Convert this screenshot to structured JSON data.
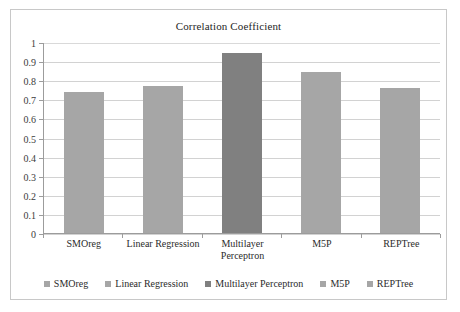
{
  "chart_data": {
    "type": "bar",
    "title": "Correlation Coefficient",
    "xlabel": "",
    "ylabel": "",
    "ylim": [
      0,
      1
    ],
    "ytick_labels": [
      "1",
      "0.9",
      "0.8",
      "0.7",
      "0.6",
      "0.5",
      "0.4",
      "0.3",
      "0.2",
      "0.1",
      "0"
    ],
    "ytick_values": [
      1,
      0.9,
      0.8,
      0.7,
      0.6,
      0.5,
      0.4,
      0.3,
      0.2,
      0.1,
      0
    ],
    "grid": true,
    "legend_position": "bottom",
    "categories": [
      "SMOreg",
      "Linear Regression",
      "Multilayer\nPerceptron",
      "M5P",
      "REPTree"
    ],
    "values": [
      0.74,
      0.775,
      0.945,
      0.845,
      0.765
    ],
    "bar_colors": [
      "#a6a6a6",
      "#a6a6a6",
      "#808080",
      "#a6a6a6",
      "#a6a6a6"
    ],
    "legend": [
      {
        "label": "SMOreg",
        "color": "#a6a6a6"
      },
      {
        "label": "Linear Regression",
        "color": "#a6a6a6"
      },
      {
        "label": "Multilayer Perceptron",
        "color": "#808080"
      },
      {
        "label": "M5P",
        "color": "#a6a6a6"
      },
      {
        "label": "REPTree",
        "color": "#a6a6a6"
      }
    ]
  },
  "colors": {
    "frame_border": "#c8c8c8",
    "gridline": "#d2d2d2",
    "axis": "#9c9c9c",
    "text": "#2b2b2b",
    "bar_light": "#a6a6a6",
    "bar_dark": "#808080"
  }
}
